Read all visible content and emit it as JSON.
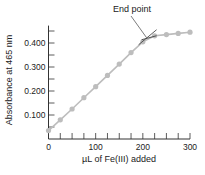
{
  "chart_data": {
    "type": "line",
    "title": "",
    "xlabel": "µL of Fe(III) added",
    "ylabel": "Absorbance at 465 nm",
    "xlim": [
      0,
      300
    ],
    "ylim": [
      0,
      0.46
    ],
    "x_ticks": [
      0,
      100,
      200,
      300
    ],
    "x_tick_labels": [
      "0",
      "100",
      "200",
      "300"
    ],
    "x_minor_tick_step": 25,
    "y_ticks": [
      0.1,
      0.2,
      0.3,
      0.4
    ],
    "y_tick_labels": [
      "0.100",
      "0.200",
      "0.300",
      "0.400"
    ],
    "y_minor_tick_step": 0.05,
    "grid": false,
    "legend": null,
    "series": [
      {
        "name": "Absorbance",
        "x": [
          0,
          25,
          50,
          75,
          100,
          125,
          150,
          175,
          200,
          225,
          250,
          275,
          300
        ],
        "values": [
          0.035,
          0.08,
          0.125,
          0.172,
          0.218,
          0.265,
          0.312,
          0.36,
          0.405,
          0.43,
          0.435,
          0.44,
          0.445
        ],
        "color": "#bdbdbd"
      }
    ],
    "annotations": [
      {
        "text": "End point",
        "x": 208,
        "y": 0.422
      }
    ]
  }
}
